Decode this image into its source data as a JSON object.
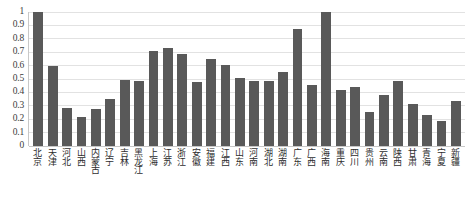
{
  "chart_data": {
    "type": "bar",
    "title": "",
    "subtitle": "",
    "xlabel": "",
    "ylabel": "",
    "ylim": [
      0,
      1
    ],
    "ytick_labels": [
      "1",
      "0.9",
      "0.8",
      "0.7",
      "0.6",
      "0.5",
      "0.4",
      "0.3",
      "0.2",
      "0.1",
      "0"
    ],
    "ytick_values": [
      1,
      0.9,
      0.8,
      0.7,
      0.6,
      0.5,
      0.4,
      0.3,
      0.2,
      0.1,
      0
    ],
    "grid": "horizontal",
    "legend": "none",
    "bar_color": "#595959",
    "gridline_color": "#e2e2e2",
    "axis_color": "#c8c8c8",
    "categories": [
      "北京",
      "天津",
      "河北",
      "山西",
      "内蒙古",
      "辽宁",
      "吉林",
      "黑龙江",
      "上海",
      "江苏",
      "浙江",
      "安徽",
      "福建",
      "江西",
      "山东",
      "河南",
      "湖北",
      "湖南",
      "广东",
      "广西",
      "海南",
      "重庆",
      "四川",
      "贵州",
      "云南",
      "陕西",
      "甘肃",
      "青海",
      "宁夏",
      "新疆"
    ],
    "values": [
      1.0,
      0.6,
      0.285,
      0.22,
      0.275,
      0.35,
      0.49,
      0.485,
      0.71,
      0.73,
      0.69,
      0.475,
      0.65,
      0.605,
      0.505,
      0.485,
      0.485,
      0.55,
      0.875,
      0.455,
      1.0,
      0.42,
      0.44,
      0.255,
      0.38,
      0.485,
      0.315,
      0.23,
      0.19,
      0.335
    ]
  }
}
